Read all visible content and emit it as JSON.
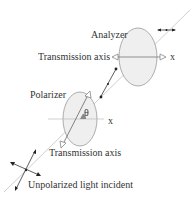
{
  "diagram": {
    "labels": {
      "analyzer": "Analyzer",
      "analyzer_axis": "Transmission axis",
      "analyzer_x": "x",
      "polarizer": "Polarizer",
      "polarizer_axis": "Transmission axis",
      "polarizer_x": "x",
      "theta": "θ",
      "incident": "Unpolarized light incident"
    },
    "colors": {
      "ellipse_fill": "#efefef",
      "ellipse_stroke": "#888888",
      "ray": "#cccccc",
      "ink": "#222222"
    }
  }
}
